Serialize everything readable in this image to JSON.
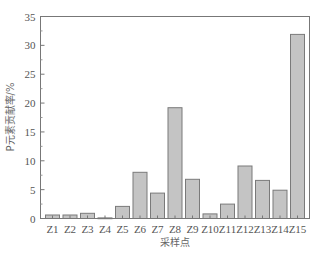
{
  "chart_data": {
    "type": "bar",
    "title": "",
    "xlabel": "采样点",
    "ylabel": "P元素贡献率/%",
    "categories": [
      "Z1",
      "Z2",
      "Z3",
      "Z4",
      "Z5",
      "Z6",
      "Z7",
      "Z8",
      "Z9",
      "Z10",
      "Z11",
      "Z12",
      "Z13",
      "Z14",
      "Z15"
    ],
    "values": [
      0.6,
      0.6,
      0.9,
      0.1,
      2.1,
      8.0,
      4.4,
      19.2,
      6.8,
      0.8,
      2.5,
      9.1,
      6.6,
      4.9,
      31.9
    ],
    "ylim": [
      0,
      35
    ],
    "yticks": [
      0,
      5,
      10,
      15,
      20,
      25,
      30,
      35
    ],
    "grid": false,
    "legend": null,
    "colors": {
      "bar_fill": "#c4c4c4",
      "bar_edge": "#7a7a7a",
      "axis": "#777777",
      "text": "#555555"
    }
  }
}
